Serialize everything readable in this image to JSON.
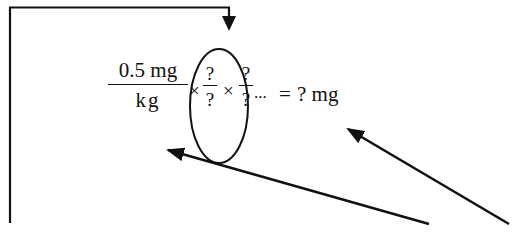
{
  "diagram": {
    "type": "dimensional-analysis-annotation",
    "equation": {
      "start_fraction": {
        "numerator": "0.5 mg",
        "denominator": "kg"
      },
      "multiply_sign": "×",
      "unknown_fractions": [
        {
          "numerator": "?",
          "denominator": "?"
        },
        {
          "numerator": "?",
          "denominator": "?"
        }
      ],
      "continuation": "...",
      "equals": "=",
      "result": "? mg"
    },
    "annotations": {
      "circle_around": "unknown conversion factors",
      "feedback_arrow": "from left margin back down into circled conversion factors",
      "pointer_arrows": [
        {
          "target": "kg denominator"
        },
        {
          "target": "? mg result"
        }
      ]
    },
    "colors": {
      "ink": "#111111",
      "background": "#ffffff"
    }
  }
}
